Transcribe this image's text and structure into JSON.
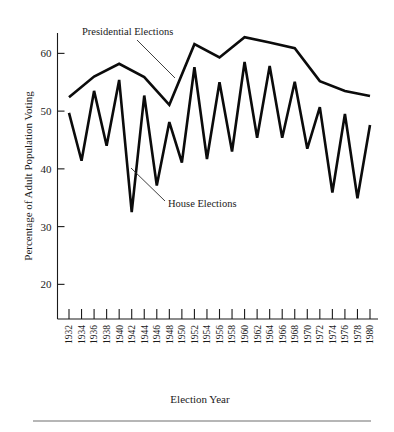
{
  "chart_data": {
    "type": "line",
    "title": "",
    "xlabel": "Election Year",
    "ylabel": "Percentage of Adult Population Voting",
    "ylim": [
      14,
      65
    ],
    "yticks": [
      20,
      30,
      40,
      50,
      60
    ],
    "ytick_labels": [
      "20",
      "30",
      "40",
      "50",
      "60"
    ],
    "grid": false,
    "legend_position": "inline-annotation",
    "x": [
      1932,
      1934,
      1936,
      1938,
      1940,
      1942,
      1944,
      1946,
      1948,
      1950,
      1952,
      1954,
      1956,
      1958,
      1960,
      1962,
      1964,
      1966,
      1968,
      1970,
      1972,
      1974,
      1976,
      1978,
      1980
    ],
    "xtick_labels": [
      "1932",
      "1934",
      "1936",
      "1938",
      "1940",
      "1942",
      "1944",
      "1946",
      "1948",
      "1950",
      "1952",
      "1954",
      "1956",
      "1958",
      "1960",
      "1962",
      "1964",
      "1966",
      "1968",
      "1970",
      "1972",
      "1974",
      "1976",
      "1978",
      "1980"
    ],
    "series": [
      {
        "name": "Presidential Elections",
        "x": [
          1932,
          1936,
          1940,
          1944,
          1948,
          1952,
          1956,
          1960,
          1964,
          1968,
          1972,
          1976,
          1980
        ],
        "values": [
          52.4,
          56.0,
          58.2,
          55.9,
          51.1,
          61.6,
          59.3,
          62.8,
          61.9,
          60.9,
          55.2,
          53.5,
          52.6
        ]
      },
      {
        "name": "House Elections",
        "x": [
          1932,
          1934,
          1936,
          1938,
          1940,
          1942,
          1944,
          1946,
          1948,
          1950,
          1952,
          1954,
          1956,
          1958,
          1960,
          1962,
          1964,
          1966,
          1968,
          1970,
          1972,
          1974,
          1976,
          1978,
          1980
        ],
        "values": [
          49.7,
          41.4,
          53.5,
          44.0,
          55.4,
          32.5,
          52.7,
          37.1,
          48.1,
          41.1,
          57.6,
          41.7,
          55.0,
          43.0,
          58.5,
          45.4,
          57.8,
          45.4,
          55.1,
          43.5,
          50.7,
          35.9,
          49.5,
          34.9,
          47.6
        ]
      }
    ],
    "annotations": [
      {
        "label": "Presidential Elections",
        "points_to_year": 1950
      },
      {
        "label": "House Elections",
        "points_to_year": 1948
      }
    ]
  },
  "figure": {
    "y_axis_title": "Percentage of Adult Population Voting",
    "x_axis_title": "Election Year",
    "presidential_label": "Presidential Elections",
    "house_label": "House Elections",
    "colors": {
      "line": "#0b0b0b",
      "axis": "#1a1a1a",
      "background": "#ffffff",
      "footer_rule": "#6f6f6f"
    }
  }
}
